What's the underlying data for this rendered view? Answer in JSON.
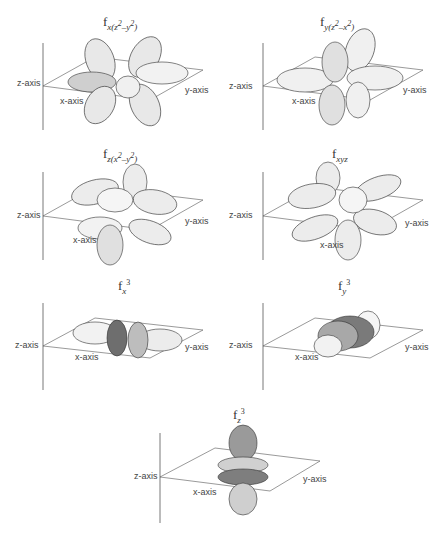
{
  "panels": [
    {
      "id": "fx_z2_y2",
      "title_base": "f",
      "title_sub": "x(z",
      "title_sup": "2",
      "title_tail": "–y",
      "title_sup2": "2",
      "title_close": ")",
      "axis_labels": {
        "z": "z-axis",
        "x": "x-axis",
        "y": "y-axis"
      }
    },
    {
      "id": "fy_z2_x2",
      "title_base": "f",
      "title_sub": "y(z",
      "title_sup": "2",
      "title_tail": "–x",
      "title_sup2": "2",
      "title_close": ")",
      "axis_labels": {
        "z": "z-axis",
        "x": "x-axis",
        "y": "y-axis"
      }
    },
    {
      "id": "fz_x2_y2",
      "title_base": "f",
      "title_sub": "z(x",
      "title_sup": "2",
      "title_tail": "–y",
      "title_sup2": "2",
      "title_close": ")",
      "axis_labels": {
        "z": "z-axis",
        "x": "x-axis",
        "y": "y-axis"
      }
    },
    {
      "id": "fxyz",
      "title_base": "f",
      "title_sub": "xyz",
      "axis_labels": {
        "z": "z-axis",
        "x": "x-axis",
        "y": "y-axis"
      }
    },
    {
      "id": "fx3",
      "title_base": "f",
      "title_sub": "x",
      "title_sup": "3",
      "axis_labels": {
        "z": "z-axis",
        "x": "x-axis",
        "y": "y-axis"
      }
    },
    {
      "id": "fy3",
      "title_base": "f",
      "title_sub": "y",
      "title_sup": "3",
      "axis_labels": {
        "z": "z-axis",
        "x": "x-axis",
        "y": "y-axis"
      }
    },
    {
      "id": "fz3",
      "title_base": "f",
      "title_sub": "z",
      "title_sup": "3",
      "axis_labels": {
        "z": "z-axis",
        "x": "x-axis",
        "y": "y-axis"
      }
    }
  ],
  "colors": {
    "line": "#555555",
    "lobe_fill": "#e6e6e6",
    "lobe_dark": "#7a7a7a",
    "mesh": "#333333"
  }
}
